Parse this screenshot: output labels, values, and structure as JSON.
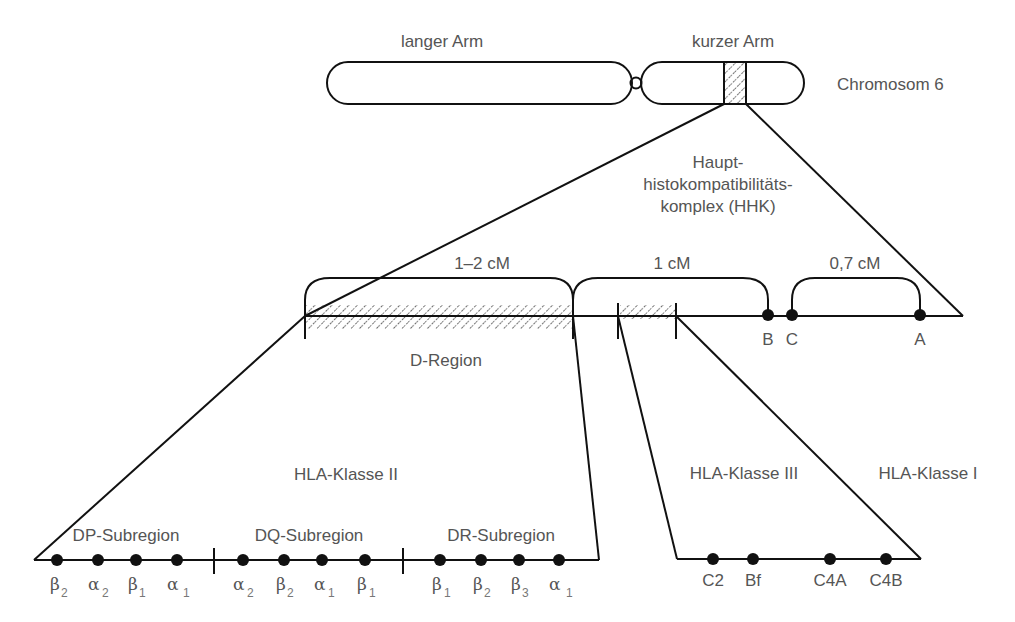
{
  "chromosome": {
    "long_arm_label": "langer Arm",
    "short_arm_label": "kurzer Arm",
    "name": "Chromosom 6"
  },
  "hhk": {
    "line1": "Haupt-",
    "line2": "histokompatibilitäts-",
    "line3": "komplex (HHK)"
  },
  "distances": {
    "d_region": "1–2 cM",
    "middle": "1 cM",
    "c_to_a": "0,7 cM"
  },
  "loci_top": {
    "b": "B",
    "c": "C",
    "a": "A"
  },
  "d_region_label": "D-Region",
  "classes": {
    "class_ii": "HLA-Klasse II",
    "class_iii": "HLA-Klasse III",
    "class_i": "HLA-Klasse I"
  },
  "subregions": [
    {
      "label": "DP-Subregion",
      "genes": [
        {
          "greek": "β",
          "sub": "2"
        },
        {
          "greek": "α",
          "sub": "2"
        },
        {
          "greek": "β",
          "sub": "1"
        },
        {
          "greek": "α",
          "sub": "1"
        }
      ]
    },
    {
      "label": "DQ-Subregion",
      "genes": [
        {
          "greek": "α",
          "sub": "2"
        },
        {
          "greek": "β",
          "sub": "2"
        },
        {
          "greek": "α",
          "sub": "1"
        },
        {
          "greek": "β",
          "sub": "1"
        }
      ]
    },
    {
      "label": "DR-Subregion",
      "genes": [
        {
          "greek": "β",
          "sub": "1"
        },
        {
          "greek": "β",
          "sub": "2"
        },
        {
          "greek": "β",
          "sub": "3"
        },
        {
          "greek": "α",
          "sub": "1"
        }
      ]
    }
  ],
  "class_iii_genes": [
    "C2",
    "Bf",
    "C4A",
    "C4B"
  ]
}
